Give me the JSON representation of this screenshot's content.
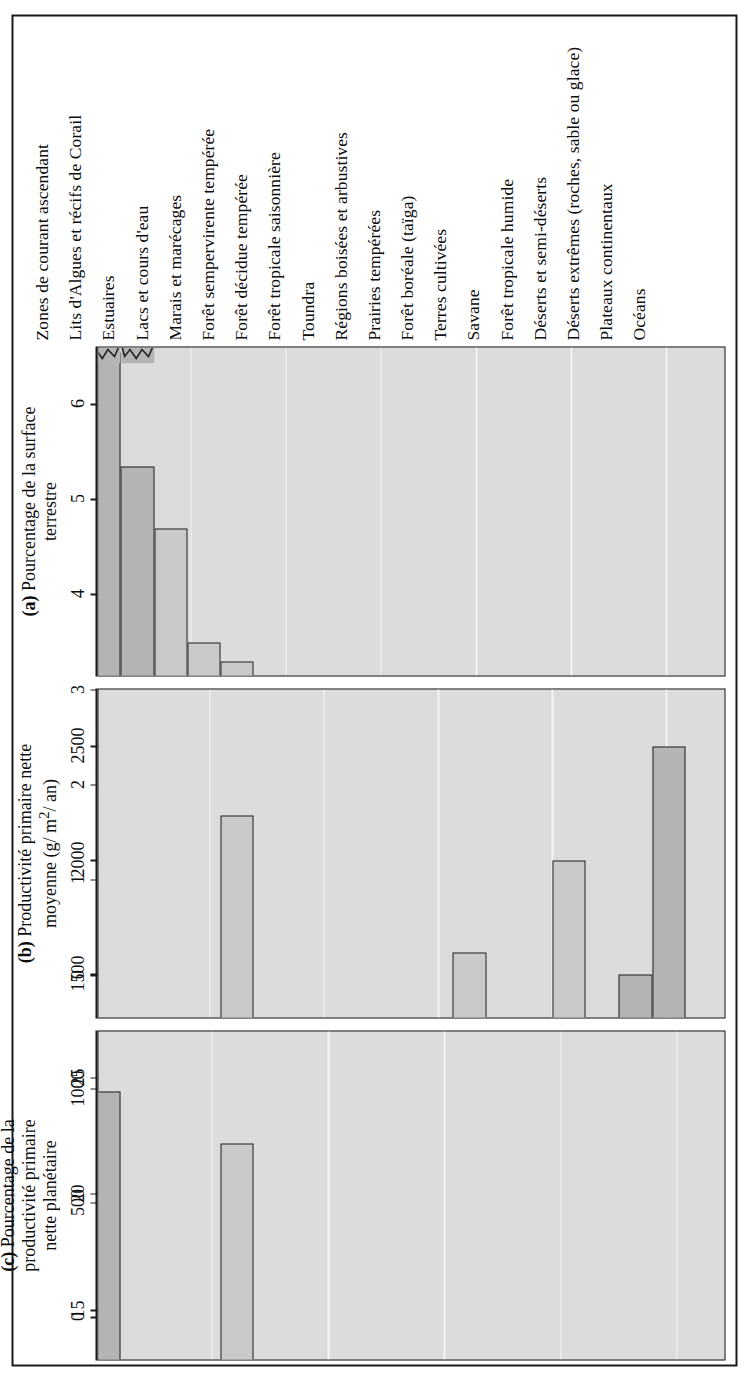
{
  "figure": {
    "kind": "three-panel-horizontal-bar-figure",
    "orientation": "rotated-90"
  },
  "chart_data": [
    {
      "type": "bar",
      "panel": "a",
      "panel_letter": "(a)",
      "title": "Pourcentage de la surface terrestre",
      "title_line1": "Pourcentage de la surface",
      "title_line2": "terrestre",
      "orientation": "horizontal",
      "xlabel": "Pourcentage de la surface terrestre",
      "ylabel": "",
      "xlim": [
        0,
        6.6
      ],
      "ticks": [
        0,
        1,
        2,
        3,
        4,
        5,
        6
      ],
      "tick_labels": [
        "0",
        "1",
        "2",
        "3",
        "4",
        "5",
        "6"
      ],
      "grid": true,
      "axis_break": true,
      "axis_break_note": "Les deux premières barres (65,0 et 5,2) sont tronquées par un symbole de rupture d'axe",
      "categories": [
        "Océans",
        "Plateaux continentaux",
        "Déserts extrêmes (roches, sable ou glace)",
        "Déserts et semi-déserts",
        "Forêt tropicale humide",
        "Savane",
        "Terres cultivées",
        "Forêt boréale (taïga)",
        "Prairies tempérées",
        "Régions boisées et arbustives",
        "Toundra",
        "Forêt tropicale saisonnière",
        "Forêt décidue tempérée",
        "Forêt sempervirente tempérée",
        "Marais et marécages",
        "Lacs et cours d'eau",
        "Estuaires",
        "Lits d'Algues et récifs de Corail",
        "Zones de courant ascendant"
      ],
      "values": [
        65.0,
        5.2,
        4.7,
        3.5,
        3.3,
        2.9,
        2.7,
        2.4,
        1.8,
        1.7,
        1.6,
        1.5,
        1.3,
        1.0,
        0.4,
        0.4,
        0.3,
        0.1,
        0.1
      ],
      "value_labels": [
        "65,0",
        "5,2",
        "4,7",
        "3,5",
        "3,3",
        "2,9",
        "2,7",
        "2,4",
        "1,8",
        "1,7",
        "1,6",
        "1,5",
        "1,3",
        "1,0",
        "0,4",
        "0,4",
        "0,3",
        "0,1",
        "0,1"
      ],
      "bar_drawn_values": [
        6.55,
        5.35,
        4.7,
        3.5,
        3.3,
        2.9,
        2.7,
        2.4,
        1.8,
        1.7,
        1.6,
        1.5,
        1.3,
        1.0,
        0.4,
        0.4,
        0.3,
        0.1,
        0.1
      ],
      "dark_bars": [
        0,
        1
      ]
    },
    {
      "type": "bar",
      "panel": "b",
      "panel_letter": "(b)",
      "title": "Productivité primaire nette moyenne (g/m2/an)",
      "title_line1": "Productivité primaire nette",
      "title_line2": "moyenne (g/ m2/ an)",
      "orientation": "horizontal",
      "xlabel": "Productivité primaire nette moyenne (g/m2/an)",
      "ylabel": "",
      "xlim": [
        0,
        2750
      ],
      "ticks": [
        0,
        500,
        1000,
        1500,
        2000,
        2500
      ],
      "tick_labels": [
        "0",
        "500",
        "1000",
        "1500",
        "2000",
        "2500"
      ],
      "grid": true,
      "categories": [
        "Océans",
        "Plateaux continentaux",
        "Déserts extrêmes (roches, sable ou glace)",
        "Déserts et semi-déserts",
        "Forêt tropicale humide",
        "Savane",
        "Terres cultivées",
        "Forêt boréale (taïga)",
        "Prairies tempérées",
        "Régions boisées et arbustives",
        "Toundra",
        "Forêt tropicale saisonnière",
        "Forêt décidue tempérée",
        "Forêt sempervirente tempérée",
        "Marais et marécages",
        "Lacs et cours d'eau",
        "Estuaires",
        "Lits d'Algues et récifs de Corail",
        "Zones de courant ascendant"
      ],
      "values": [
        125,
        360,
        3,
        90,
        2200,
        900,
        650,
        800,
        600,
        700,
        140,
        1600,
        1200,
        1300,
        2000,
        250,
        1500,
        2500,
        500
      ],
      "dark_bars": [
        16,
        17,
        18
      ]
    },
    {
      "type": "bar",
      "panel": "c",
      "panel_letter": "(c)",
      "title": "Pourcentage de la productivité primaire nette planétaire",
      "title_line1": "Pourcentage de la",
      "title_line2": "productivité primaire",
      "title_line3": "nette planétaire",
      "orientation": "horizontal",
      "xlabel": "Pourcentage de la productivité primaire nette planétaire",
      "ylabel": "",
      "xlim": [
        0,
        27
      ],
      "ticks": [
        0,
        5,
        10,
        15,
        20,
        25
      ],
      "tick_labels": [
        "0",
        "5",
        "10",
        "15",
        "20",
        "25"
      ],
      "grid": true,
      "categories": [
        "Océans",
        "Plateaux continentaux",
        "Déserts extrêmes (roches, sable ou glace)",
        "Déserts et semi-déserts",
        "Forêt tropicale humide",
        "Savane",
        "Terres cultivées",
        "Forêt boréale (taïga)",
        "Prairies tempérées",
        "Régions boisées et arbustives",
        "Toundra",
        "Forêt tropicale saisonnière",
        "Forêt décidue tempérée",
        "Forêt sempervirente tempérée",
        "Marais et marécages",
        "Lacs et cours d'eau",
        "Estuaires",
        "Lits d'Algues et récifs de Corail",
        "Zones de courant ascendant"
      ],
      "values": [
        24.4,
        8.0,
        0.3,
        1.0,
        22.2,
        8.0,
        5.5,
        6.0,
        3.5,
        4.0,
        0.5,
        7.3,
        5.3,
        4.3,
        2.7,
        0.6,
        1.8,
        1.0,
        0.3
      ],
      "dark_bars": [
        0,
        1,
        16,
        17,
        18
      ]
    }
  ]
}
